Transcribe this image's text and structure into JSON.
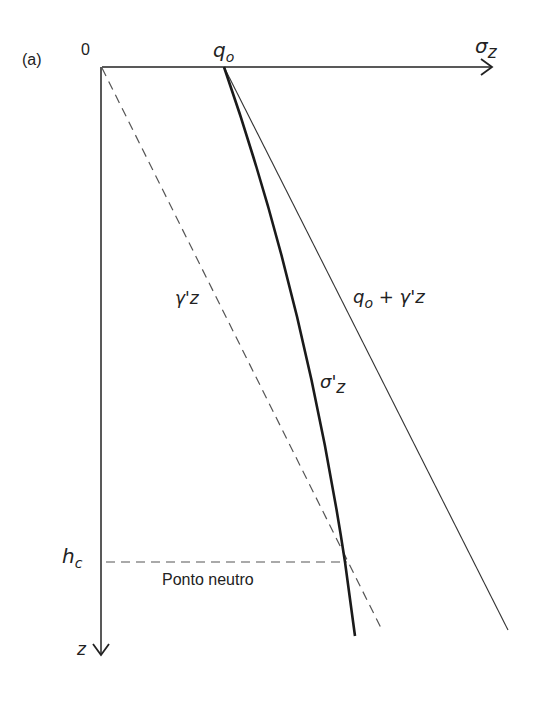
{
  "figure": {
    "panel_label": "(a)",
    "origin_label": "0",
    "x_axis_label": "σ",
    "x_axis_sub": "z",
    "z_axis_label": "z",
    "q0_label": "q",
    "q0_sub": "o",
    "hc_label": "h",
    "hc_sub": "c",
    "neutral_point_label": "Ponto neutro"
  },
  "curves": {
    "gamma_z": {
      "label": "γ'z",
      "style": "dashed"
    },
    "sigma_eff": {
      "label": "σ'",
      "sub": "z",
      "style": "thick-solid"
    },
    "total": {
      "label_pre": "q",
      "label_sub": "o",
      "label_post": " + γ'z",
      "style": "thin-solid"
    }
  },
  "colors": {
    "line": "#222222",
    "dash": "#555555",
    "text": "#222222"
  }
}
